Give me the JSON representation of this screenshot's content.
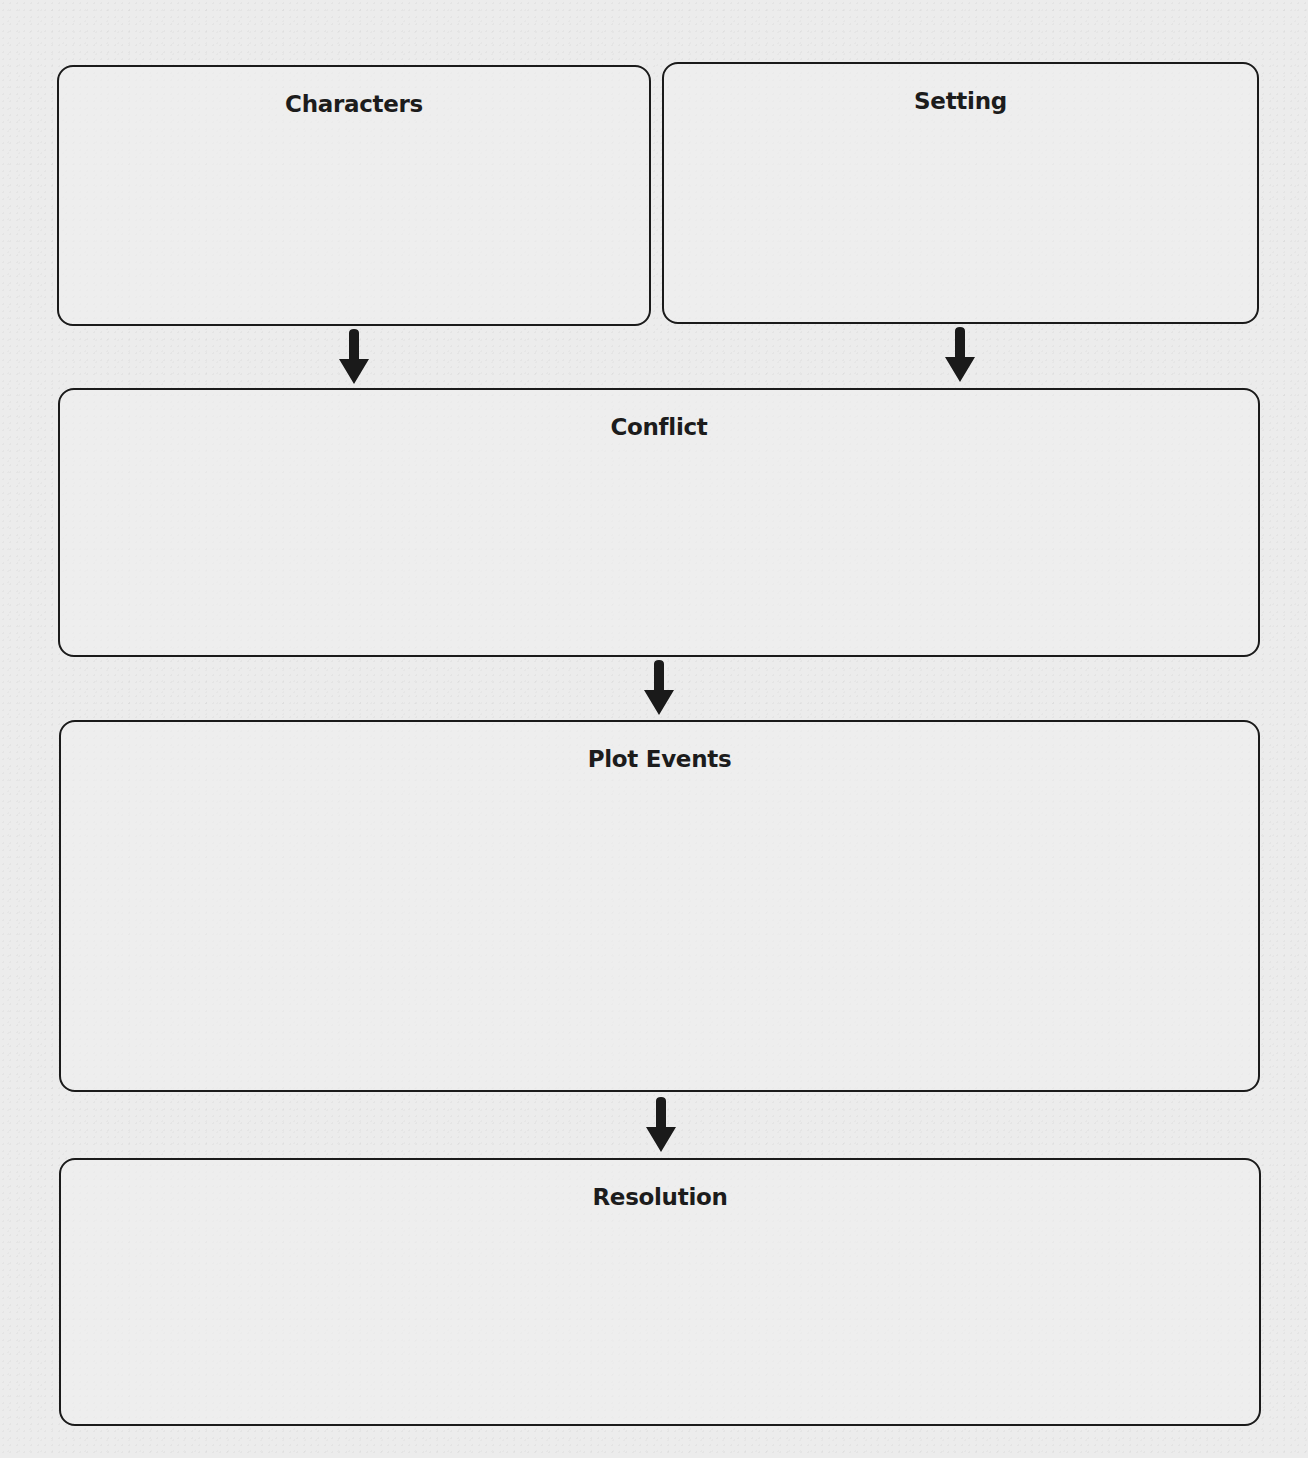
{
  "worksheet": {
    "title": "Story Map",
    "boxes": {
      "characters": {
        "heading": "Characters"
      },
      "setting": {
        "heading": "Setting"
      },
      "conflict": {
        "heading": "Conflict"
      },
      "plot_events": {
        "heading": "Plot Events"
      },
      "resolution": {
        "heading": "Resolution"
      }
    },
    "arrows": [
      {
        "from": "Characters",
        "to": "Conflict",
        "icon": "arrow-down-icon"
      },
      {
        "from": "Setting",
        "to": "Conflict",
        "icon": "arrow-down-icon"
      },
      {
        "from": "Conflict",
        "to": "Plot Events",
        "icon": "arrow-down-icon"
      },
      {
        "from": "Plot Events",
        "to": "Resolution",
        "icon": "arrow-down-icon"
      }
    ],
    "colors": {
      "paper": "#ececec",
      "ink": "#1a1a1a"
    }
  }
}
